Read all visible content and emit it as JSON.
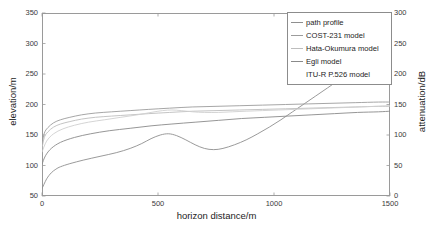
{
  "chart_data": {
    "type": "line",
    "title": "",
    "xlabel": "horizon distance/m",
    "ylabel": "elevation/m",
    "y2label": "attenuation/dB",
    "xlim": [
      0,
      1500
    ],
    "ylim": [
      50,
      350
    ],
    "y2lim": [
      0,
      300
    ],
    "xticks": [
      "0",
      "500",
      "1000",
      "1500"
    ],
    "yticks": [
      "50",
      "100",
      "150",
      "200",
      "250",
      "300",
      "350"
    ],
    "y2ticks": [
      "0",
      "50",
      "100",
      "150",
      "200",
      "250",
      "300"
    ],
    "grid": false,
    "legend_position": "top-right",
    "series": [
      {
        "name": "path profile",
        "axis": "left",
        "color": "#8f8f8f",
        "x": [
          0,
          20,
          40,
          60,
          80,
          120,
          180,
          250,
          320,
          380,
          430,
          470,
          510,
          545,
          580,
          620,
          660,
          700,
          740,
          780,
          830,
          880,
          930,
          980,
          1030,
          1080,
          1130,
          1180,
          1230,
          1280,
          1320,
          1360,
          1400,
          1450,
          1500
        ],
        "y": [
          62,
          78,
          88,
          94,
          98,
          103,
          109,
          115,
          121,
          128,
          136,
          144,
          150,
          152,
          149,
          142,
          134,
          128,
          126,
          128,
          134,
          142,
          152,
          163,
          175,
          188,
          201,
          214,
          227,
          240,
          249,
          252,
          252,
          252,
          252
        ]
      },
      {
        "name": "COST-231 model",
        "axis": "right",
        "color": "#9c9c9c",
        "x": [
          0,
          10,
          25,
          50,
          80,
          120,
          170,
          230,
          300,
          380,
          460,
          550,
          650,
          750,
          850,
          950,
          1050,
          1150,
          1250,
          1350,
          1450,
          1500
        ],
        "y": [
          85,
          103,
          112,
          120,
          125,
          129,
          133,
          136,
          138,
          140,
          142,
          144,
          146,
          147,
          148,
          149,
          150,
          151,
          152,
          153,
          154,
          154
        ]
      },
      {
        "name": "Hata-Okumura model",
        "axis": "right",
        "color": "#bdbdbd",
        "x": [
          0,
          10,
          25,
          50,
          80,
          120,
          170,
          230,
          300,
          380,
          460,
          550,
          650,
          750,
          850,
          950,
          1050,
          1150,
          1250,
          1350,
          1450,
          1500
        ],
        "y": [
          78,
          96,
          105,
          113,
          118,
          122,
          126,
          129,
          131,
          133,
          135,
          137,
          139,
          140,
          141,
          142,
          143,
          144,
          145,
          146,
          147,
          147
        ]
      },
      {
        "name": "Egli model",
        "axis": "right",
        "color": "#8a8a8a",
        "x": [
          0,
          15,
          40,
          80,
          140,
          210,
          290,
          380,
          470,
          560,
          660,
          760,
          860,
          960,
          1060,
          1160,
          1260,
          1360,
          1450,
          1500
        ],
        "y": [
          52,
          66,
          78,
          88,
          96,
          102,
          107,
          111,
          115,
          118,
          121,
          124,
          127,
          129,
          131,
          133,
          135,
          137,
          138,
          139
        ]
      },
      {
        "name": "ITU-R P.526 model",
        "axis": "right",
        "color": "#cfcfcf",
        "x": [
          0,
          20,
          50,
          90,
          140,
          200,
          270,
          340,
          410,
          470,
          520,
          560,
          600,
          650,
          700,
          760,
          820,
          880,
          950,
          1020,
          1090,
          1160,
          1230,
          1300,
          1370,
          1440,
          1500
        ],
        "y": [
          72,
          90,
          102,
          110,
          116,
          121,
          125,
          129,
          133,
          137,
          140,
          141,
          140,
          138,
          137,
          137,
          138,
          139,
          140,
          141,
          142,
          143,
          144,
          145,
          146,
          147,
          148
        ]
      }
    ]
  },
  "legend": {
    "entries": [
      {
        "label": "path profile"
      },
      {
        "label": "COST-231 model"
      },
      {
        "label": "Hata-Okumura model"
      },
      {
        "label": "Egli model"
      },
      {
        "label": "ITU-R P.526 model"
      }
    ]
  }
}
